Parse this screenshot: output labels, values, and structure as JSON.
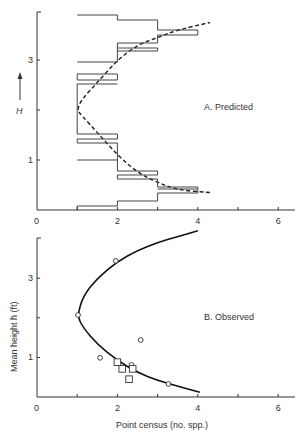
{
  "chart_data": [
    {
      "type": "line",
      "panel": "A",
      "title": "A. Predicted",
      "xlabel": "",
      "ylabel": "H",
      "xlim": [
        0,
        6.5
      ],
      "ylim": [
        0,
        4
      ],
      "x_ticks": [
        0,
        2,
        4,
        6
      ],
      "y_ticks": [
        1,
        3
      ],
      "grid": false,
      "series": [
        {
          "name": "predicted curve (dashed)",
          "style": "dashed",
          "points": [
            [
              4.3,
              0.35
            ],
            [
              3.5,
              0.4
            ],
            [
              3,
              0.55
            ],
            [
              2.5,
              0.75
            ],
            [
              2,
              1.1
            ],
            [
              1.5,
              1.55
            ],
            [
              1.1,
              1.9
            ],
            [
              1.0,
              2.0
            ],
            [
              1.1,
              2.2
            ],
            [
              1.5,
              2.55
            ],
            [
              2,
              3.0
            ],
            [
              2.5,
              3.3
            ],
            [
              3,
              3.45
            ],
            [
              3.5,
              3.6
            ],
            [
              4.3,
              3.75
            ]
          ]
        },
        {
          "name": "step histogram",
          "style": "step",
          "segments": [
            {
              "h": 3.9,
              "x0": 1,
              "x1": 2
            },
            {
              "h": 3.8,
              "x0": 2,
              "x1": 3
            },
            {
              "h": 3.6,
              "x0": 3,
              "x1": 4
            },
            {
              "h": 3.5,
              "x0": 3,
              "x1": 4
            },
            {
              "h": 3.34,
              "x0": 2,
              "x1": 3
            },
            {
              "h": 3.24,
              "x0": 2,
              "x1": 3
            },
            {
              "h": 3.18,
              "x0": 2,
              "x1": 3
            },
            {
              "h": 2.96,
              "x0": 1,
              "x1": 2
            },
            {
              "h": 2.72,
              "x0": 1,
              "x1": 2
            },
            {
              "h": 2.6,
              "x0": 1,
              "x1": 2
            },
            {
              "h": 2.52,
              "x0": 1,
              "x1": 2
            },
            {
              "h": 1.52,
              "x0": 1,
              "x1": 2
            },
            {
              "h": 1.42,
              "x0": 1,
              "x1": 2
            },
            {
              "h": 1.34,
              "x0": 1,
              "x1": 2
            },
            {
              "h": 1.0,
              "x0": 1,
              "x1": 2
            },
            {
              "h": 0.78,
              "x0": 2,
              "x1": 3
            },
            {
              "h": 0.7,
              "x0": 2,
              "x1": 3
            },
            {
              "h": 0.62,
              "x0": 2,
              "x1": 3
            },
            {
              "h": 0.46,
              "x0": 3,
              "x1": 4
            },
            {
              "h": 0.42,
              "x0": 3,
              "x1": 4
            },
            {
              "h": 0.34,
              "x0": 3,
              "x1": 4
            },
            {
              "h": 0.18,
              "x0": 2,
              "x1": 3
            },
            {
              "h": 0.08,
              "x0": 1,
              "x1": 2
            }
          ]
        }
      ]
    },
    {
      "type": "scatter",
      "panel": "B",
      "title": "B. Observed",
      "xlabel": "Point census (no. spp.)",
      "ylabel": "Mean height h̄ (ft)",
      "xlim": [
        0,
        6.5
      ],
      "ylim": [
        0,
        4
      ],
      "x_ticks": [
        0,
        2,
        4,
        6
      ],
      "y_ticks": [
        1,
        3
      ],
      "grid": false,
      "series": [
        {
          "name": "fitted curve",
          "style": "solid",
          "points": [
            [
              4.05,
              0.12
            ],
            [
              3.5,
              0.27
            ],
            [
              3,
              0.42
            ],
            [
              2.5,
              0.62
            ],
            [
              2,
              0.92
            ],
            [
              1.5,
              1.33
            ],
            [
              1.15,
              1.75
            ],
            [
              1.0,
              2.05
            ],
            [
              1.15,
              2.55
            ],
            [
              1.5,
              3.0
            ],
            [
              2,
              3.42
            ],
            [
              2.5,
              3.7
            ],
            [
              3,
              3.9
            ],
            [
              3.5,
              4.05
            ],
            [
              4,
              4.2
            ]
          ]
        },
        {
          "name": "circles",
          "marker": "circle",
          "points": [
            [
              1.96,
              3.44
            ],
            [
              1.02,
              2.07
            ],
            [
              1.57,
              0.99
            ],
            [
              2.35,
              0.81
            ],
            [
              2.58,
              1.44
            ],
            [
              3.27,
              0.33
            ]
          ]
        },
        {
          "name": "squares",
          "marker": "square",
          "points": [
            [
              2.0,
              0.88
            ],
            [
              2.12,
              0.71
            ],
            [
              2.38,
              0.71
            ],
            [
              2.29,
              0.45
            ]
          ]
        }
      ]
    }
  ],
  "labels": {
    "panel_a": "A. Predicted",
    "panel_b": "B. Observed",
    "y_a": "H",
    "y_b": "Mean height h̄ (ft)",
    "x_b": "Point census (no. spp.)",
    "tick_x": [
      "0",
      "2",
      "4",
      "6"
    ],
    "tick_y": [
      "1",
      "3"
    ]
  }
}
